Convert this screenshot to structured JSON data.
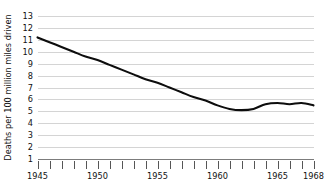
{
  "chart_data": {
    "type": "line",
    "title": "",
    "subtitle": "",
    "xlabel": "",
    "ylabel": "Deaths per 100 million miles driven",
    "xlim": [
      1945,
      1968
    ],
    "ylim": [
      1,
      13
    ],
    "grid": true,
    "grid_axis": "y",
    "legend": false,
    "legend_position": "none",
    "x_tick_labels": [
      "1945",
      "1950",
      "1955",
      "1960",
      "1965",
      "1968"
    ],
    "x_tick_label_values": [
      1945,
      1950,
      1955,
      1960,
      1965,
      1968
    ],
    "x_minor_ticks": [
      1945,
      1946,
      1947,
      1948,
      1949,
      1950,
      1951,
      1952,
      1953,
      1954,
      1955,
      1956,
      1957,
      1958,
      1959,
      1960,
      1961,
      1962,
      1963,
      1964,
      1965,
      1966,
      1967,
      1968
    ],
    "y_tick_labels": [
      "1",
      "2",
      "3",
      "4",
      "5",
      "6",
      "7",
      "8",
      "9",
      "10",
      "11",
      "12",
      "13"
    ],
    "y_tick_values": [
      1,
      2,
      3,
      4,
      5,
      6,
      7,
      8,
      9,
      10,
      11,
      12,
      13
    ],
    "x": [
      1945,
      1946,
      1947,
      1948,
      1949,
      1950,
      1951,
      1952,
      1953,
      1954,
      1955,
      1956,
      1957,
      1958,
      1959,
      1960,
      1961,
      1962,
      1963,
      1964,
      1965,
      1966,
      1967,
      1968
    ],
    "values": [
      11.2,
      10.8,
      10.4,
      10.0,
      9.6,
      9.3,
      8.9,
      8.5,
      8.1,
      7.7,
      7.4,
      7.0,
      6.6,
      6.2,
      5.9,
      5.5,
      5.2,
      5.1,
      5.2,
      5.6,
      5.7,
      5.6,
      5.7,
      5.5
    ],
    "series": [
      {
        "name": "Deaths per 100 million miles driven",
        "color": "#0d0d0d",
        "values": [
          11.2,
          10.8,
          10.4,
          10.0,
          9.6,
          9.3,
          8.9,
          8.5,
          8.1,
          7.7,
          7.4,
          7.0,
          6.6,
          6.2,
          5.9,
          5.5,
          5.2,
          5.1,
          5.2,
          5.6,
          5.7,
          5.6,
          5.7,
          5.5
        ]
      }
    ]
  },
  "colors": {
    "background": "#ffffff",
    "line": "#0d0d0d",
    "gridline": "#c9c9c9",
    "baseline": "#6e6e6e",
    "tick": "#444444",
    "text": "#111111"
  }
}
